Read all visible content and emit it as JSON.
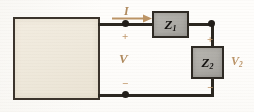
{
  "diagram": {
    "background_color": "#fefdfb"
  },
  "source_block": {
    "label": "",
    "fill_color": "#efe9dc",
    "border_color": "#3b342c"
  },
  "components": {
    "z1": {
      "label": "Z",
      "subscript": "1",
      "fill_color": "#aeaca7",
      "border_color": "#2e2a24"
    },
    "z2": {
      "label": "Z",
      "subscript": "2",
      "fill_color": "#aeaca7",
      "border_color": "#2e2a24"
    }
  },
  "annotations": {
    "current": {
      "label": "I",
      "color": "#b08a5e",
      "direction": "right"
    },
    "voltage_source": {
      "label": "V",
      "plus": "+",
      "minus": "−",
      "color": "#b08a5e"
    },
    "voltage_z2": {
      "label": "V",
      "subscript": "2",
      "plus": "+",
      "minus": "−",
      "color": "#bb9468"
    }
  },
  "wires": {
    "color": "#2b2720",
    "node_color": "#221e19",
    "node_count": 3
  }
}
